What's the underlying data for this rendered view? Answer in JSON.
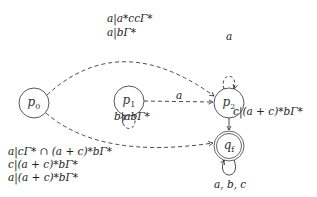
{
  "diagram": {
    "type": "automaton",
    "nodes": [
      {
        "id": "p0",
        "label": "p",
        "sub": "0",
        "accepting": false
      },
      {
        "id": "p1",
        "label": "p",
        "sub": "1",
        "accepting": false
      },
      {
        "id": "p2",
        "label": "p",
        "sub": "2",
        "accepting": false
      },
      {
        "id": "qf",
        "label": "q",
        "sub": "f",
        "accepting": true
      }
    ],
    "edges": [
      {
        "from": "p0",
        "to": "p2",
        "style": "dashed",
        "labels": [
          "a|a*ccΓ*",
          "a|bΓ*"
        ]
      },
      {
        "from": "p1",
        "to": "p2",
        "style": "dashed",
        "labels": [
          "a"
        ]
      },
      {
        "from": "p2",
        "to": "p2",
        "style": "dashed",
        "labels": [
          "a"
        ]
      },
      {
        "from": "p1",
        "to": "p1",
        "style": "dashed",
        "labels": [
          "b|abΓ*"
        ]
      },
      {
        "from": "p2",
        "to": "qf",
        "style": "solid",
        "labels": [
          "c|(a + c)*bΓ*"
        ]
      },
      {
        "from": "p0",
        "to": "qf",
        "style": "dashed",
        "labels": [
          "a|cΓ* ∩ (a + c)*bΓ*",
          "c|(a + c)*bΓ*",
          "a|(a + c)*bΓ*"
        ]
      },
      {
        "from": "qf",
        "to": "qf",
        "style": "solid",
        "labels": [
          "a, b, c"
        ]
      }
    ]
  },
  "text": {
    "p0_p2_line1": "a|a*ccΓ*",
    "p0_p2_line2": "a|bΓ*",
    "p1_p2": "a",
    "p2_loop": "a",
    "p1_loop": "b|abΓ*",
    "p2_qf": "c|(a + c)*bΓ*",
    "p0_qf_line1": "a|cΓ* ∩ (a + c)*bΓ*",
    "p0_qf_line2": "c|(a + c)*bΓ*",
    "p0_qf_line3": "a|(a + c)*bΓ*",
    "qf_loop": "a, b, c",
    "p0_label": "p",
    "p0_sub": "0",
    "p1_label": "p",
    "p1_sub": "1",
    "p2_label": "p",
    "p2_sub": "2",
    "qf_label": "q",
    "qf_sub": "f"
  }
}
